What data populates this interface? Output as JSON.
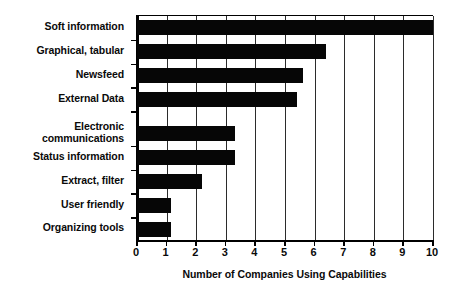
{
  "chart_data": {
    "type": "bar",
    "orientation": "horizontal",
    "title": "",
    "xlabel": "Number of Companies Using Capabilities",
    "ylabel": "",
    "xlim": [
      0,
      10
    ],
    "xticks": [
      "0",
      "1",
      "2",
      "3",
      "4",
      "5",
      "6",
      "7",
      "8",
      "9",
      "10"
    ],
    "grid": true,
    "legend": false,
    "bar_color": "#060606",
    "categories": [
      "Soft information",
      "Graphical, tabular",
      "Newsfeed",
      "External Data",
      "Electronic\ncommunications",
      "Status information",
      "Extract, filter",
      "User friendly",
      "Organizing tools"
    ],
    "values": [
      10,
      6.4,
      5.6,
      5.4,
      3.3,
      3.3,
      2.2,
      1.15,
      1.15
    ]
  }
}
